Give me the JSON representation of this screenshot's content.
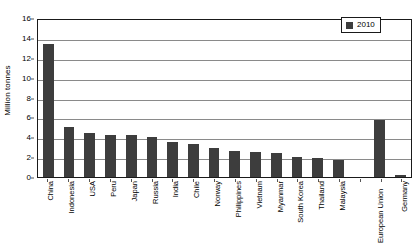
{
  "chart_data": {
    "type": "bar",
    "title": "",
    "subtitle": "",
    "xlabel": "",
    "ylabel": "Million tonnes",
    "ylim": [
      0,
      16
    ],
    "y_ticks": [
      0,
      2,
      4,
      6,
      8,
      10,
      12,
      14,
      16
    ],
    "grid": true,
    "legend_position": "top-right",
    "legend": [
      "2010"
    ],
    "series": [
      {
        "name": "2010",
        "color": "#3d3d3d",
        "values": [
          13.4,
          5.0,
          4.4,
          4.25,
          4.2,
          4.0,
          3.5,
          3.3,
          2.9,
          2.6,
          2.5,
          2.4,
          2.0,
          1.9,
          1.7,
          null,
          5.7,
          0.25
        ]
      }
    ],
    "categories": [
      "China",
      "Indonesia",
      "USA",
      "Peru",
      "Japan",
      "Russia",
      "India",
      "Chile",
      "Norway",
      "Philippines",
      "Vietnam",
      "Myanmar",
      "South Korea",
      "Thailand",
      "Malaysia",
      "",
      "European Union",
      "Germany"
    ]
  },
  "legend": {
    "entries": [
      {
        "label": "2010",
        "color": "#3d3d3d"
      }
    ]
  },
  "axes": {
    "y_title": "Million tonnes",
    "y_tick_labels": [
      "16",
      "14",
      "12",
      "10",
      "8",
      "6",
      "4",
      "2",
      "0"
    ]
  }
}
